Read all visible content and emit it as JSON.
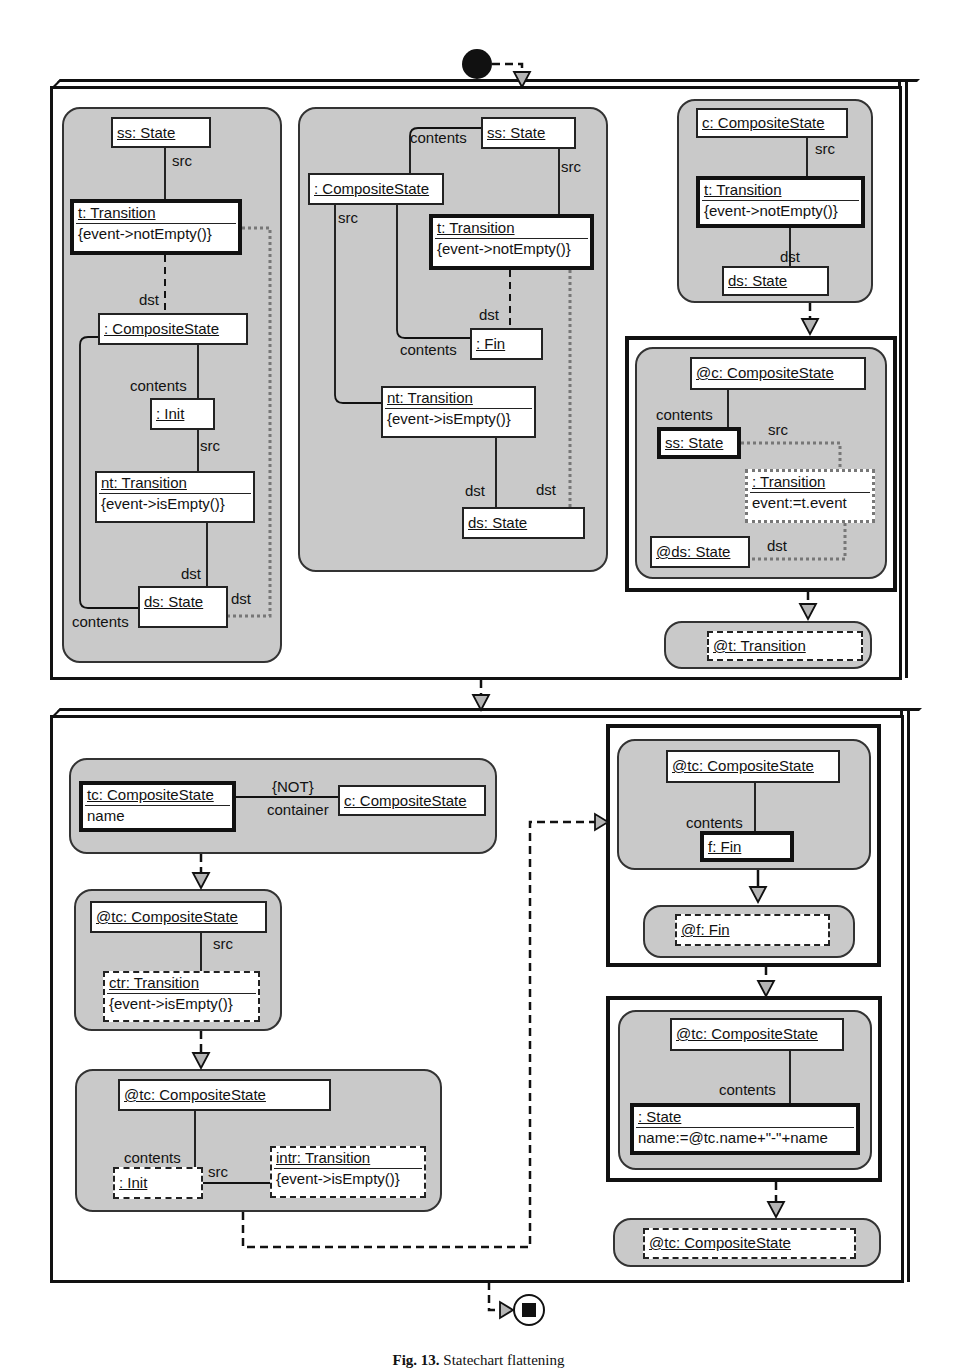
{
  "caption": {
    "label": "Fig. 13.",
    "text": "Statechart flattening"
  },
  "colors": {
    "region_fill": "#c9c9c9",
    "line": "#111111",
    "arrow_fill": "#b5b5b5",
    "dotted_line": "#777777"
  },
  "top_frame": {
    "pattern1": {
      "ss": "ss: State",
      "src": "src",
      "t": "t: Transition",
      "t_constraint": "{event->notEmpty()}",
      "dst1": "dst",
      "cs": ": CompositeState",
      "contents1": "contents",
      "init": ": Init",
      "src2": "src",
      "nt": "nt: Transition",
      "nt_constraint": "{event->isEmpty()}",
      "dst2": "dst",
      "ds": "ds: State",
      "dst3": "dst",
      "contents2": "contents"
    },
    "pattern2": {
      "contents1": "contents",
      "ss": "ss: State",
      "src1": "src",
      "cs": ": CompositeState",
      "src2": "src",
      "t": "t: Transition",
      "t_constraint": "{event->notEmpty()}",
      "dst1": "dst",
      "contents2": "contents",
      "fin": ": Fin",
      "nt": "nt: Transition",
      "nt_constraint": "{event->isEmpty()}",
      "dst2": "dst",
      "dst3": "dst",
      "ds": "ds: State"
    },
    "pattern3": {
      "c": "c: CompositeState",
      "src": "src",
      "t": "t: Transition",
      "t_constraint": "{event->notEmpty()}",
      "dst": "dst",
      "ds": "ds: State"
    },
    "rule1": {
      "c": "@c: CompositeState",
      "contents": "contents",
      "ss": "ss: State",
      "src": "src",
      "tr": ": Transition",
      "tr_attr": "event:=t.event",
      "ds": "@ds: State",
      "dst": "dst"
    },
    "delete1": {
      "t": "@t: Transition"
    }
  },
  "bottom_frame": {
    "pattern1": {
      "tc": "tc: CompositeState",
      "tc_attr": "name",
      "not": "{NOT}",
      "container": "container",
      "c": "c: CompositeState"
    },
    "pattern2": {
      "tc": "@tc: CompositeState",
      "src": "src",
      "ctr": "ctr: Transition",
      "ctr_constraint": "{event->isEmpty()}"
    },
    "pattern3": {
      "tc": "@tc: CompositeState",
      "contents": "contents",
      "init": ": Init",
      "src": "src",
      "intr": "intr: Transition",
      "intr_constraint": "{event->isEmpty()}"
    },
    "rule1": {
      "tc": "@tc: CompositeState",
      "contents": "contents",
      "f": "f: Fin",
      "delete_f": "@f: Fin"
    },
    "rule2": {
      "tc": "@tc: CompositeState",
      "contents": "contents",
      "state": ": State",
      "state_attr": "name:=@tc.name+\"-\"+name"
    },
    "delete_tc": {
      "tc": "@tc: CompositeState"
    }
  }
}
